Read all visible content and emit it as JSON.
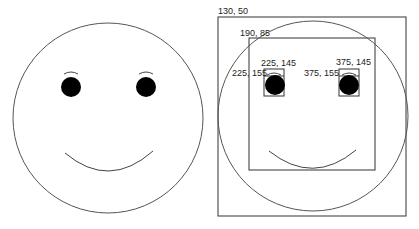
{
  "diagram": {
    "left_face": {
      "description": "plain smiley face",
      "stroke": "#555555",
      "eye_fill": "#000000"
    },
    "right_face": {
      "description": "smiley face with coordinate bounding boxes",
      "stroke": "#555555",
      "box_stroke": "#333333",
      "labels": {
        "outer_box": "130, 50",
        "inner_box": "190, 85",
        "left_brow": "225, 145",
        "left_eye": "225, 155",
        "right_brow": "375, 145",
        "right_eye": "375, 155"
      }
    }
  }
}
